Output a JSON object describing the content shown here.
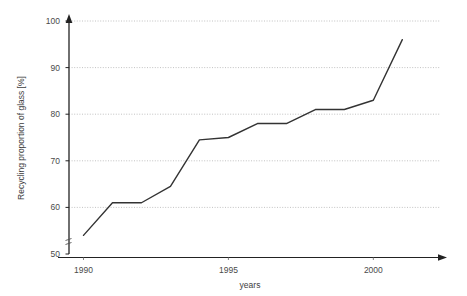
{
  "chart_data": {
    "type": "line",
    "title": "",
    "subtitle": "",
    "xlabel": "years",
    "ylabel": "Recycling proportion of glass [%]",
    "x": [
      1990,
      1991,
      1992,
      1993,
      1994,
      1995,
      1996,
      1997,
      1998,
      1999,
      2000,
      2001
    ],
    "values": [
      54,
      61,
      61,
      64.5,
      74.5,
      75,
      78,
      78,
      81,
      81,
      83,
      96
    ],
    "series": [
      {
        "name": "Recycling proportion of glass",
        "values": [
          54,
          61,
          61,
          64.5,
          74.5,
          75,
          78,
          78,
          81,
          81,
          83,
          96
        ]
      }
    ],
    "xlim": [
      1989.5,
      2002.3
    ],
    "ylim": [
      50,
      100
    ],
    "y_ticks": [
      50,
      60,
      70,
      80,
      90,
      100
    ],
    "y_tick_labels": [
      "50",
      "60",
      "70",
      "80",
      "90",
      "100"
    ],
    "x_ticks": [
      1990,
      1995,
      2000
    ],
    "x_tick_labels": [
      "1990",
      "1995",
      "2000"
    ],
    "grid": true,
    "grid_axis": "y",
    "grid_style": "dotted",
    "legend": false,
    "legend_position": "none",
    "axis_break_y": true,
    "line_color": "#333333",
    "grid_color": "#bbbbbb",
    "axis_color": "#222222",
    "markers": false
  },
  "axes": {
    "y_title": "Recycling proportion of glass [%]",
    "x_title": "years",
    "y_labels": [
      "100",
      "90",
      "80",
      "70",
      "60",
      "50"
    ],
    "x_labels": [
      "1990",
      "1995",
      "2000"
    ]
  }
}
